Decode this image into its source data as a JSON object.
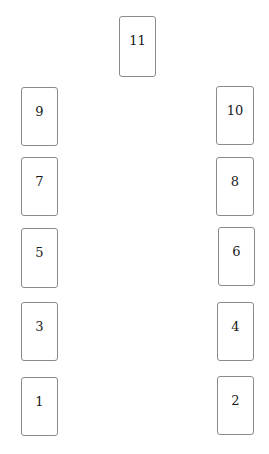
{
  "layout": {
    "title": "",
    "cards": [
      {
        "label": "11",
        "x": 119,
        "y": 16,
        "w": 37,
        "h": 61
      },
      {
        "label": "9",
        "x": 21,
        "y": 87,
        "w": 37,
        "h": 59
      },
      {
        "label": "10",
        "x": 216,
        "y": 86,
        "w": 38,
        "h": 59
      },
      {
        "label": "7",
        "x": 21,
        "y": 157,
        "w": 37,
        "h": 59
      },
      {
        "label": "8",
        "x": 216,
        "y": 157,
        "w": 38,
        "h": 59
      },
      {
        "label": "5",
        "x": 21,
        "y": 228,
        "w": 37,
        "h": 60
      },
      {
        "label": "6",
        "x": 218,
        "y": 227,
        "w": 37,
        "h": 59
      },
      {
        "label": "3",
        "x": 21,
        "y": 302,
        "w": 37,
        "h": 59
      },
      {
        "label": "4",
        "x": 217,
        "y": 302,
        "w": 37,
        "h": 59
      },
      {
        "label": "1",
        "x": 21,
        "y": 377,
        "w": 37,
        "h": 59
      },
      {
        "label": "2",
        "x": 217,
        "y": 376,
        "w": 37,
        "h": 59
      }
    ]
  }
}
